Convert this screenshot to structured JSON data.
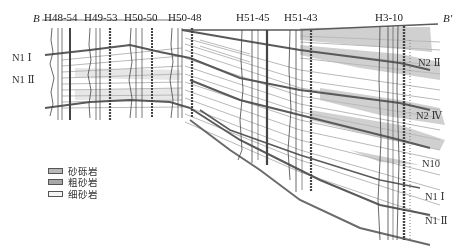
{
  "section": {
    "start_label": "B",
    "end_label": "B′"
  },
  "wells": [
    {
      "name": "H48-54",
      "x": 60
    },
    {
      "name": "H49-53",
      "x": 100
    },
    {
      "name": "H50-50",
      "x": 140
    },
    {
      "name": "H50-48",
      "x": 182
    },
    {
      "name": "H51-45",
      "x": 250
    },
    {
      "name": "H51-43",
      "x": 297
    },
    {
      "name": "H3-10",
      "x": 392
    }
  ],
  "layers_left": [
    {
      "label": "N1 Ⅰ",
      "y": 57
    },
    {
      "label": "N1 Ⅱ",
      "y": 79
    }
  ],
  "layers_right": [
    {
      "label": "N2 Ⅱ",
      "y": 62
    },
    {
      "label": "N2 Ⅳ",
      "y": 115
    },
    {
      "label": "N10",
      "y": 163
    },
    {
      "label": "N1 Ⅰ",
      "y": 196
    },
    {
      "label": "N1 Ⅱ",
      "y": 220
    }
  ],
  "legend": [
    {
      "label": "砂砾岩",
      "color": "#b8b8b8"
    },
    {
      "label": "粗砂岩",
      "color": "#a8a8a8"
    },
    {
      "label": "细砂岩",
      "color": "#f4f4f4"
    }
  ],
  "colors": {
    "boundary": "#5a5a5a",
    "sand_fill": "#c4c4c4",
    "thin_bed": "#b9b9b9",
    "log": "#444444"
  }
}
